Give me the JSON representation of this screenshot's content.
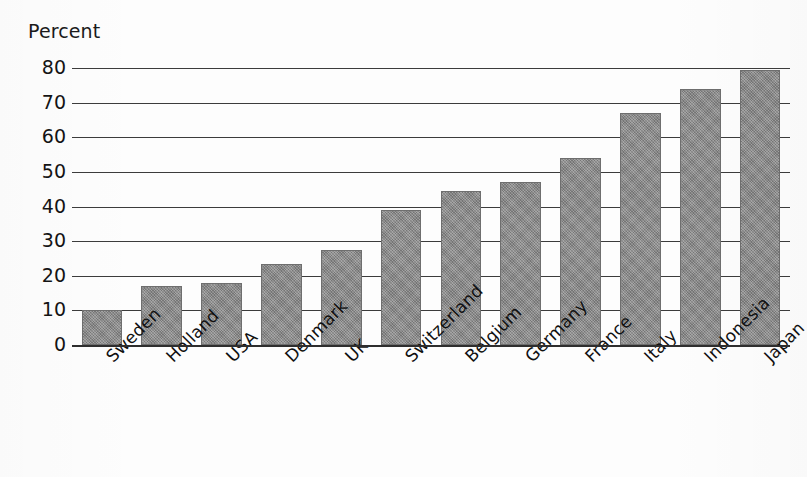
{
  "chart_data": {
    "type": "bar",
    "title": "",
    "ylabel": "Percent",
    "xlabel": "",
    "ylim": [
      0,
      80
    ],
    "yticks": [
      0,
      10,
      20,
      30,
      40,
      50,
      60,
      70,
      80
    ],
    "ytick_labels": [
      "0",
      "10",
      "20",
      "30",
      "40",
      "50",
      "60",
      "70",
      "80"
    ],
    "grid": true,
    "legend": false,
    "orientation": "vertical",
    "bar_color": "#8c8c8c",
    "categories": [
      "Sweden",
      "Holland",
      "USA",
      "Denmark",
      "UK",
      "Switzerland",
      "Belgium",
      "Germany",
      "France",
      "Italy",
      "Indonesia",
      "Japan"
    ],
    "values": [
      10,
      17,
      18,
      23.5,
      27.5,
      39,
      44.5,
      47,
      54,
      67,
      74,
      79.5
    ]
  }
}
